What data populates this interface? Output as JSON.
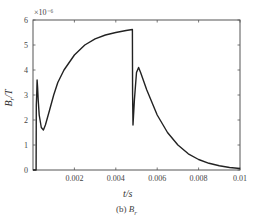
{
  "chart_data": {
    "type": "line",
    "title": "",
    "caption": {
      "prefix": "(b)",
      "symbol": "B",
      "subscript": "r"
    },
    "xlabel": "t/s",
    "ylabel": "B/T",
    "ylabel_subscript": "r",
    "y_multiplier": "×10⁻⁶",
    "xlim": [
      0,
      0.01
    ],
    "ylim": [
      0,
      6
    ],
    "xticks": [
      0.002,
      0.004,
      0.006,
      0.008,
      0.01
    ],
    "xtick_labels": [
      "0.002",
      "0.004",
      "0.006",
      "0.008",
      "0.01"
    ],
    "yticks": [
      0,
      1,
      2,
      3,
      4,
      5,
      6
    ],
    "ytick_labels": [
      "0",
      "1",
      "2",
      "3",
      "4",
      "5",
      "6"
    ],
    "grid": false,
    "legend": null,
    "series": [
      {
        "name": "Br",
        "color": "#222222",
        "x": [
          0,
          0.00015,
          0.00016,
          0.00018,
          0.0002,
          0.00022,
          0.00025,
          0.0003,
          0.0004,
          0.0005,
          0.0006,
          0.0008,
          0.001,
          0.0012,
          0.0015,
          0.002,
          0.0025,
          0.003,
          0.0035,
          0.004,
          0.0045,
          0.0048,
          0.00481,
          0.00483,
          0.0049,
          0.005,
          0.0051,
          0.0052,
          0.0055,
          0.006,
          0.0065,
          0.007,
          0.0075,
          0.008,
          0.0085,
          0.009,
          0.0095,
          0.01
        ],
        "values": [
          0,
          0,
          2.6,
          3.0,
          3.6,
          3.3,
          2.8,
          2.2,
          1.7,
          1.6,
          1.8,
          2.4,
          3.0,
          3.5,
          4.0,
          4.6,
          5.0,
          5.25,
          5.4,
          5.5,
          5.58,
          5.62,
          3.0,
          1.8,
          2.8,
          3.9,
          4.1,
          3.9,
          3.2,
          2.2,
          1.5,
          1.0,
          0.65,
          0.42,
          0.27,
          0.17,
          0.1,
          0.06
        ]
      }
    ]
  }
}
